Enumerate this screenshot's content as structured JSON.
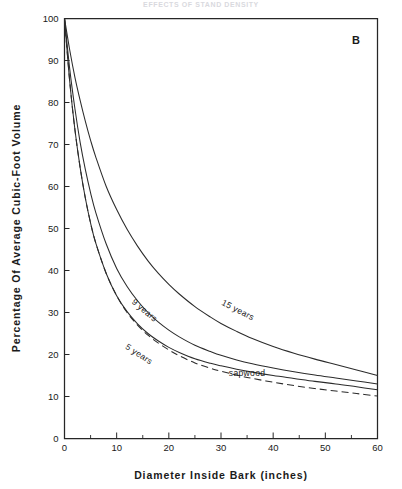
{
  "figure": {
    "running_head": "EFFECTS OF STAND DENSITY",
    "panel_label": "B",
    "background": "#ffffff",
    "ink_color": "#2b2b2b"
  },
  "chart_data": {
    "type": "line",
    "title": "",
    "subtitle": "",
    "panel": "B",
    "xlabel": "Diameter  Inside  Bark  (inches)",
    "ylabel": "Percentage  Of  Average  Cubic-Foot  Volume",
    "xlim": [
      0,
      60
    ],
    "ylim": [
      0,
      100
    ],
    "xticks": [
      0,
      10,
      20,
      30,
      40,
      50,
      60
    ],
    "xtick_labels": [
      "0",
      "10",
      "20",
      "30",
      "40",
      "50",
      "60"
    ],
    "xticks_minor": [
      5,
      15,
      25,
      35,
      45,
      55
    ],
    "yticks": [
      0,
      10,
      20,
      30,
      40,
      50,
      60,
      70,
      80,
      90,
      100
    ],
    "ytick_labels": [
      "0",
      "10",
      "20",
      "30",
      "40",
      "50",
      "60",
      "70",
      "80",
      "90",
      "100"
    ],
    "grid": false,
    "legend": "inline-curve-labels",
    "x": [
      0,
      1,
      2,
      3,
      4,
      5,
      6,
      8,
      10,
      12,
      14,
      16,
      18,
      20,
      22,
      25,
      28,
      30,
      33,
      36,
      40,
      44,
      48,
      52,
      56,
      60
    ],
    "series": [
      {
        "name": "15 years",
        "style": "solid",
        "label": "15 years",
        "label_x": 33,
        "label_y": 30,
        "label_rotation": 27,
        "values": [
          100,
          92.5,
          86,
          80.5,
          75.5,
          71,
          67,
          60,
          54.5,
          49.8,
          45.8,
          42.3,
          39.3,
          36.7,
          34.4,
          31.4,
          28.9,
          27.4,
          25.5,
          23.8,
          21.9,
          20.3,
          18.9,
          17.6,
          16.3,
          15.0
        ]
      },
      {
        "name": "9 years",
        "style": "solid",
        "label": "9 years",
        "label_x": 15,
        "label_y": 30,
        "label_rotation": 40,
        "values": [
          100,
          88,
          78.5,
          70.5,
          64,
          58.5,
          53.8,
          46.3,
          40.5,
          36.2,
          32.8,
          30.0,
          27.7,
          25.8,
          24.2,
          22.2,
          20.7,
          19.8,
          18.7,
          17.8,
          16.8,
          15.9,
          15.1,
          14.4,
          13.7,
          13.0
        ]
      },
      {
        "name": "5 years",
        "style": "solid",
        "label": "5 years",
        "label_x": 14,
        "label_y": 19.5,
        "label_rotation": 33,
        "values": [
          100,
          85,
          73.5,
          64.5,
          57.2,
          51.3,
          46.5,
          39.3,
          34.0,
          30.2,
          27.3,
          25.0,
          23.2,
          21.7,
          20.5,
          19.0,
          17.9,
          17.3,
          16.5,
          15.8,
          15.0,
          14.3,
          13.6,
          13.0,
          12.3,
          11.6
        ]
      },
      {
        "name": "sapwood",
        "style": "dashed",
        "label": "sapwood",
        "label_x": 35,
        "label_y": 14.8,
        "label_rotation": 0,
        "values": [
          100,
          85,
          73.5,
          64.5,
          57.2,
          51.3,
          46.5,
          39.3,
          34.0,
          30.0,
          27.0,
          24.6,
          22.7,
          21.1,
          19.7,
          18.0,
          16.7,
          16.0,
          15.1,
          14.3,
          13.4,
          12.6,
          11.9,
          11.3,
          10.7,
          10.1
        ]
      }
    ]
  }
}
